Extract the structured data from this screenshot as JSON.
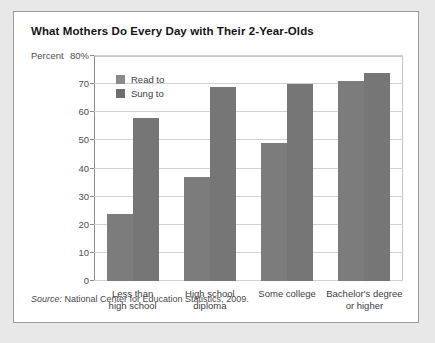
{
  "figure": {
    "title": "What Mothers Do Every Day with Their 2-Year-Olds",
    "percent_label": "Percent",
    "source_prefix": "Source:",
    "source_text": "National Center for Education Statistics, 2009."
  },
  "chart_data": {
    "type": "bar",
    "title": "What Mothers Do Every Day with Their 2-Year-Olds",
    "xlabel": "",
    "ylabel": "Percent",
    "ylim": [
      0,
      80
    ],
    "yticks": [
      0,
      10,
      20,
      30,
      40,
      50,
      60,
      70,
      80
    ],
    "ytick_labels": [
      "0",
      "10",
      "20",
      "30",
      "40",
      "50",
      "60",
      "70",
      "80%"
    ],
    "grid": true,
    "legend_position": "upper-left-inside",
    "categories": [
      "Less than high school",
      "High school diploma",
      "Some college",
      "Bachelor's degree or higher"
    ],
    "category_lines": [
      [
        "Less than",
        "high school"
      ],
      [
        "High school",
        "diploma"
      ],
      [
        "Some college",
        ""
      ],
      [
        "Bachelor's degree",
        "or higher"
      ]
    ],
    "series": [
      {
        "name": "Read to",
        "color": "#7c7c7c",
        "values": [
          24,
          37,
          49,
          71
        ]
      },
      {
        "name": "Sung to",
        "color": "#767676",
        "values": [
          58,
          69,
          70,
          74
        ]
      }
    ]
  }
}
